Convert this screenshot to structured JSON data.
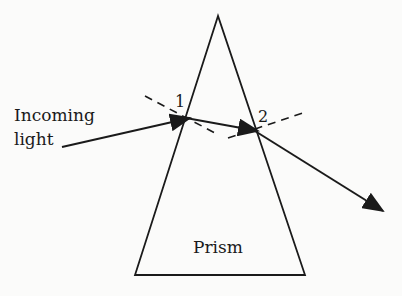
{
  "diagram": {
    "type": "prism-refraction",
    "labels": {
      "incoming_line1": "Incoming",
      "incoming_line2": "light",
      "point1": "1",
      "point2": "2",
      "prism": "Prism"
    },
    "colors": {
      "line": "#1a1a1a",
      "background": "#fbfbfa"
    }
  }
}
